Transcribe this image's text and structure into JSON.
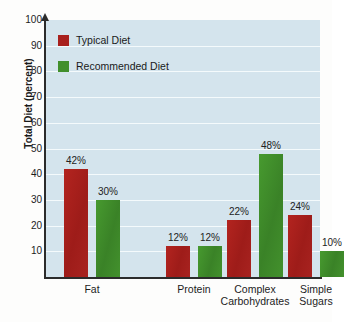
{
  "chart_data": {
    "type": "bar",
    "title": "",
    "xlabel": "",
    "ylabel": "Total Diet (percent)",
    "ylim": [
      0,
      100
    ],
    "ytick_step": 10,
    "yticks": [
      100,
      90,
      80,
      70,
      60,
      50,
      40,
      30,
      20,
      10
    ],
    "grid": true,
    "legend_position": "top-left",
    "categories": [
      "Fat",
      "Protein",
      "Complex Carbohydrates",
      "Simple Sugars"
    ],
    "category_lines": [
      [
        "Fat",
        ""
      ],
      [
        "Protein",
        ""
      ],
      [
        "Complex",
        "Carbohydrates"
      ],
      [
        "Simple",
        "Sugars"
      ]
    ],
    "series": [
      {
        "name": "Typical Diet",
        "color": "#a8201d",
        "values": [
          42,
          12,
          22,
          24
        ],
        "labels": [
          "42%",
          "12%",
          "22%",
          "24%"
        ]
      },
      {
        "name": "Recommended Diet",
        "color": "#418f2c",
        "values": [
          30,
          12,
          48,
          10
        ],
        "labels": [
          "30%",
          "12%",
          "48%",
          "10%"
        ]
      }
    ],
    "colors": {
      "typical_diet": "#a8201d",
      "recommended_diet": "#418f2c",
      "plot_background": "#d4e4ed",
      "gridline": "#f4fafc",
      "axis": "#2b2b2b",
      "page_background": "#fdfdfc"
    }
  },
  "legend": {
    "items": [
      {
        "label": "Typical Diet",
        "swatch": "red-swatch-icon"
      },
      {
        "label": "Recommended Diet",
        "swatch": "green-swatch-icon"
      }
    ]
  },
  "axes": {
    "y_title": "Total Diet (percent)",
    "y_tick_labels": [
      "100",
      "90",
      "80",
      "70",
      "60",
      "50",
      "40",
      "30",
      "20",
      "10"
    ]
  }
}
